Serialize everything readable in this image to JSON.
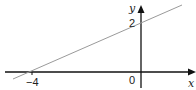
{
  "diagram": {
    "type": "linear-graph",
    "x_axis_label": "x",
    "y_axis_label": "y",
    "origin_label": "0",
    "x_intercept_label": "−4",
    "y_intercept_label": "2",
    "line": {
      "x_intercept": -4,
      "y_intercept": 2,
      "slope": 0.5
    },
    "colors": {
      "axes": "#111111",
      "line": "#9a9a9a",
      "text": "#222222"
    }
  }
}
